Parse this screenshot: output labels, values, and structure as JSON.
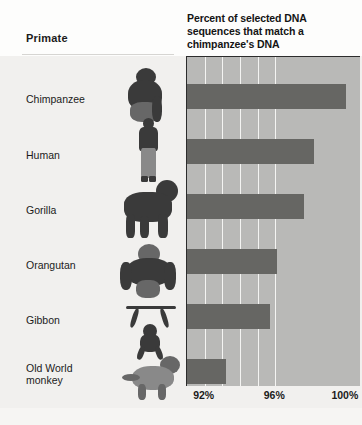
{
  "header": {
    "primate_column_label": "Primate",
    "chart_title": "Percent of selected DNA sequences that match a chimpanzee's DNA"
  },
  "rows": [
    {
      "label": "Chimpanzee",
      "photo": "chimpanzee-photo"
    },
    {
      "label": "Human",
      "photo": "human-photo"
    },
    {
      "label": "Gorilla",
      "photo": "gorilla-photo"
    },
    {
      "label": "Orangutan",
      "photo": "orangutan-photo"
    },
    {
      "label": "Gibbon",
      "photo": "gibbon-photo"
    },
    {
      "label": "Old World\nmonkey",
      "photo": "old-world-monkey-photo"
    }
  ],
  "axis": {
    "ticks": [
      "92%",
      "96%",
      "100%"
    ],
    "tick_values": [
      92,
      96,
      100
    ]
  },
  "colors": {
    "bar": "#666663",
    "plot_background": "#b9b9b7",
    "gridline": "#f4f4f2",
    "page_background": "#f1f0ee",
    "axis_rule": "#2c2c2c",
    "text": "#1b1b1b"
  },
  "chart_data": {
    "type": "bar",
    "orientation": "horizontal",
    "title": "Percent of selected DNA sequences that match a chimpanzee's DNA",
    "xlabel": "",
    "ylabel": "Primate",
    "categories": [
      "Chimpanzee",
      "Human",
      "Gorilla",
      "Orangutan",
      "Gibbon",
      "Old World monkey"
    ],
    "values": [
      100.0,
      98.2,
      97.6,
      96.1,
      95.7,
      93.2
    ],
    "unit": "%",
    "xlim": [
      91,
      100.8
    ],
    "tick_labels": [
      "92%",
      "96%",
      "100%"
    ],
    "tick_values": [
      92,
      96,
      100
    ],
    "gridlines_every": 1,
    "grid": true,
    "legend": "none"
  }
}
